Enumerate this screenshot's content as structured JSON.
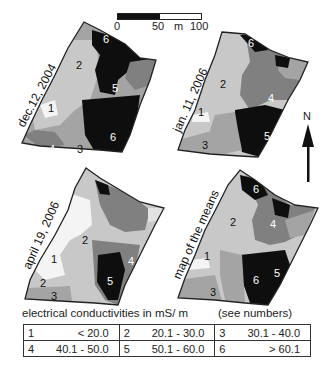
{
  "scale_bar": {
    "labels": [
      "0",
      "50",
      "m",
      "100"
    ],
    "unit": "m"
  },
  "north_arrow": {
    "label": "N"
  },
  "maps": [
    {
      "id": "dec-2004",
      "title": "dec.12, 2004",
      "zones": [
        "6",
        "2",
        "5",
        "1",
        "6",
        "4",
        "3"
      ]
    },
    {
      "id": "jan-2006",
      "title": "jan. 11, 2006",
      "zones": [
        "6",
        "2",
        "4",
        "1",
        "5",
        "3"
      ]
    },
    {
      "id": "apr-2006",
      "title": "april 19, 2006",
      "zones": [
        "2",
        "4",
        "1",
        "5",
        "2",
        "3"
      ]
    },
    {
      "id": "means",
      "title": "map of the means",
      "zones": [
        "6",
        "2",
        "4",
        "1",
        "6",
        "5",
        "3"
      ]
    }
  ],
  "legend": {
    "title": "electrical conductivities in mS/ m",
    "note": "(see numbers)",
    "rows": [
      [
        {
          "num": "1",
          "range": "< 20.0"
        },
        {
          "num": "2",
          "range": "20.1 - 30.0"
        },
        {
          "num": "3",
          "range": "30.1 - 40.0"
        }
      ],
      [
        {
          "num": "4",
          "range": "40.1 - 50.0"
        },
        {
          "num": "5",
          "range": "50.1 - 60.0"
        },
        {
          "num": "6",
          "range": "> 60.1"
        }
      ]
    ]
  },
  "colors": {
    "class1": "#f4f4f4",
    "class2": "#c8c8c8",
    "class3": "#a4a4a4",
    "class4": "#808080",
    "class5": "#4a4a4a",
    "class6": "#0e0e0e"
  }
}
